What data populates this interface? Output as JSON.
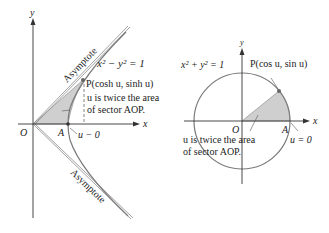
{
  "colors": {
    "curve": "#7a7a7a",
    "axis": "#333333",
    "shade": "#cfcfcf",
    "text": "#222222",
    "background": "#ffffff"
  },
  "left": {
    "axis_y_label": "y",
    "axis_x_label": "x",
    "equation": "x² − y² = 1",
    "point_label": "P(cosh u, sinh u)",
    "note_line1": "u is twice the area",
    "note_line2": "of sector AOP.",
    "origin_label": "O",
    "a_label": "A",
    "u_zero_label": "u − 0",
    "asymptote_upper": "Asymptote",
    "asymptote_lower": "Asymptote"
  },
  "right": {
    "axis_y_label": "y",
    "axis_x_label": "x",
    "equation": "x² + y² = 1",
    "point_label": "P(cos u, sin u)",
    "note_line1": "u is twice the area",
    "note_line2": "of sector AOP.",
    "origin_label": "O",
    "a_label": "A",
    "u_zero_label": "u = 0"
  }
}
